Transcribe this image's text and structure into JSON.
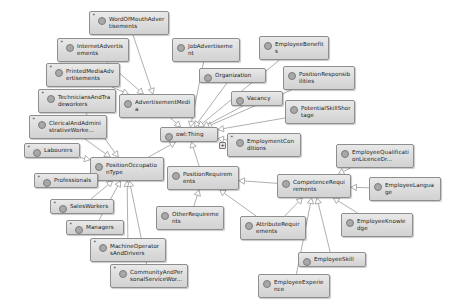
{
  "diagram": {
    "type": "owl-class-graph",
    "background_color": "#ffffff",
    "node_fill_color": "#dcdcdc",
    "node_border_color": "#8e8e8e",
    "edge_color": "#9a9a9a",
    "root_label": "owl:Thing"
  },
  "nodes": [
    {
      "id": "wordofmouth",
      "label": "WordOfMouthAdvertisements",
      "x": 89,
      "y": 11,
      "w": 80,
      "h": 24,
      "asterisk": true,
      "expander": null
    },
    {
      "id": "internetadv",
      "label": "InternetAdvertisements",
      "x": 57,
      "y": 38,
      "w": 72,
      "h": 24,
      "asterisk": true,
      "expander": null
    },
    {
      "id": "jobadvertisement",
      "label": "JobAdvertisement",
      "x": 172,
      "y": 38,
      "w": 68,
      "h": 24,
      "asterisk": false,
      "expander": null
    },
    {
      "id": "employeebenefits",
      "label": "EmployeeBenefits",
      "x": 259,
      "y": 36,
      "w": 70,
      "h": 24,
      "asterisk": false,
      "expander": null
    },
    {
      "id": "printedmedia",
      "label": "PrintedMediaAdvertisements",
      "x": 46,
      "y": 63,
      "w": 74,
      "h": 24,
      "asterisk": true,
      "expander": null
    },
    {
      "id": "organization",
      "label": "Organization",
      "x": 199,
      "y": 68,
      "w": 67,
      "h": 15,
      "asterisk": false,
      "expander": null
    },
    {
      "id": "positionresponsibilities",
      "label": "PositionResponsibilities",
      "x": 283,
      "y": 66,
      "w": 72,
      "h": 24,
      "asterisk": false,
      "expander": null
    },
    {
      "id": "technicians",
      "label": "TechniciansAndTradeworkers",
      "x": 38,
      "y": 89,
      "w": 78,
      "h": 24,
      "asterisk": true,
      "expander": null
    },
    {
      "id": "advertisementmedia",
      "label": "AdvertisementMedia",
      "x": 119,
      "y": 94,
      "w": 76,
      "h": 24,
      "asterisk": false,
      "expander": null
    },
    {
      "id": "vacancy",
      "label": "Vacancy",
      "x": 231,
      "y": 91,
      "w": 52,
      "h": 15,
      "asterisk": false,
      "expander": null
    },
    {
      "id": "potentialskillshortage",
      "label": "PotentialSkillShortage",
      "x": 285,
      "y": 100,
      "w": 70,
      "h": 24,
      "asterisk": false,
      "expander": null
    },
    {
      "id": "clerical",
      "label": "ClericalAndAdministrativeWorke...",
      "x": 29,
      "y": 115,
      "w": 78,
      "h": 24,
      "asterisk": true,
      "expander": null
    },
    {
      "id": "owlthing",
      "label": "owl:Thing",
      "x": 160,
      "y": 127,
      "w": 58,
      "h": 15,
      "asterisk": false,
      "expander": null
    },
    {
      "id": "employmentconditions",
      "label": "EmploymentConditions",
      "x": 227,
      "y": 133,
      "w": 74,
      "h": 24,
      "asterisk": true,
      "expander": "+"
    },
    {
      "id": "labourers",
      "label": "Labourers",
      "x": 24,
      "y": 143,
      "w": 56,
      "h": 15,
      "asterisk": true,
      "expander": null
    },
    {
      "id": "positionoccupationtype",
      "label": "PositionOccupationType",
      "x": 90,
      "y": 157,
      "w": 74,
      "h": 24,
      "asterisk": false,
      "expander": null
    },
    {
      "id": "positionrequirements",
      "label": "PositionRequirements",
      "x": 167,
      "y": 166,
      "w": 72,
      "h": 24,
      "asterisk": false,
      "expander": null
    },
    {
      "id": "employeequalification",
      "label": "EmployeeQualificationLicenceDr...",
      "x": 336,
      "y": 144,
      "w": 78,
      "h": 24,
      "asterisk": false,
      "expander": null
    },
    {
      "id": "professionals",
      "label": "Professionals",
      "x": 34,
      "y": 173,
      "w": 64,
      "h": 15,
      "asterisk": true,
      "expander": null
    },
    {
      "id": "competencerequirements",
      "label": "CompetenceRequirements",
      "x": 277,
      "y": 174,
      "w": 74,
      "h": 24,
      "asterisk": false,
      "expander": null
    },
    {
      "id": "employeelanguage",
      "label": "EmployeeLanguage",
      "x": 369,
      "y": 177,
      "w": 72,
      "h": 24,
      "asterisk": false,
      "expander": null
    },
    {
      "id": "salesworkers",
      "label": "SalesWorkers",
      "x": 50,
      "y": 199,
      "w": 64,
      "h": 15,
      "asterisk": true,
      "expander": null
    },
    {
      "id": "otherrequirements",
      "label": "OtherRequirements",
      "x": 156,
      "y": 206,
      "w": 68,
      "h": 24,
      "asterisk": false,
      "expander": null
    },
    {
      "id": "attributerequirements",
      "label": "AttributeRequirements",
      "x": 240,
      "y": 216,
      "w": 66,
      "h": 24,
      "asterisk": false,
      "expander": null
    },
    {
      "id": "employeeknowledge",
      "label": "EmployeeKnowledge",
      "x": 341,
      "y": 213,
      "w": 72,
      "h": 24,
      "asterisk": false,
      "expander": null
    },
    {
      "id": "managers",
      "label": "Managers",
      "x": 66,
      "y": 220,
      "w": 58,
      "h": 15,
      "asterisk": true,
      "expander": null
    },
    {
      "id": "machineoperators",
      "label": "MachineOperatorsAndDrivers",
      "x": 90,
      "y": 238,
      "w": 76,
      "h": 24,
      "asterisk": true,
      "expander": null
    },
    {
      "id": "employeeskill",
      "label": "EmployeeSkill",
      "x": 298,
      "y": 252,
      "w": 68,
      "h": 15,
      "asterisk": false,
      "expander": null
    },
    {
      "id": "community",
      "label": "CommunityAndPersonalServiceWor...",
      "x": 110,
      "y": 264,
      "w": 78,
      "h": 24,
      "asterisk": true,
      "expander": null
    },
    {
      "id": "employeeexperience",
      "label": "EmployeeExperience",
      "x": 258,
      "y": 274,
      "w": 72,
      "h": 24,
      "asterisk": false,
      "expander": null
    }
  ],
  "edges": [
    {
      "from": "wordofmouth",
      "to": "advertisementmedia"
    },
    {
      "from": "internetadv",
      "to": "advertisementmedia"
    },
    {
      "from": "printedmedia",
      "to": "advertisementmedia"
    },
    {
      "from": "advertisementmedia",
      "to": "owlthing"
    },
    {
      "from": "jobadvertisement",
      "to": "owlthing"
    },
    {
      "from": "organization",
      "to": "owlthing"
    },
    {
      "from": "employeebenefits",
      "to": "owlthing"
    },
    {
      "from": "positionresponsibilities",
      "to": "owlthing"
    },
    {
      "from": "vacancy",
      "to": "owlthing"
    },
    {
      "from": "potentialskillshortage",
      "to": "owlthing"
    },
    {
      "from": "employmentconditions",
      "to": "owlthing"
    },
    {
      "from": "positionoccupationtype",
      "to": "owlthing"
    },
    {
      "from": "positionrequirements",
      "to": "owlthing"
    },
    {
      "from": "technicians",
      "to": "positionoccupationtype"
    },
    {
      "from": "clerical",
      "to": "positionoccupationtype"
    },
    {
      "from": "labourers",
      "to": "positionoccupationtype"
    },
    {
      "from": "professionals",
      "to": "positionoccupationtype"
    },
    {
      "from": "salesworkers",
      "to": "positionoccupationtype"
    },
    {
      "from": "managers",
      "to": "positionoccupationtype"
    },
    {
      "from": "machineoperators",
      "to": "positionoccupationtype"
    },
    {
      "from": "community",
      "to": "positionoccupationtype"
    },
    {
      "from": "otherrequirements",
      "to": "positionrequirements"
    },
    {
      "from": "attributerequirements",
      "to": "positionrequirements"
    },
    {
      "from": "competencerequirements",
      "to": "positionrequirements"
    },
    {
      "from": "employeequalification",
      "to": "competencerequirements"
    },
    {
      "from": "employeelanguage",
      "to": "competencerequirements"
    },
    {
      "from": "employeeknowledge",
      "to": "competencerequirements"
    },
    {
      "from": "employeeskill",
      "to": "competencerequirements"
    },
    {
      "from": "employeeexperience",
      "to": "competencerequirements"
    },
    {
      "from": "attributerequirements",
      "to": "competencerequirements"
    }
  ]
}
